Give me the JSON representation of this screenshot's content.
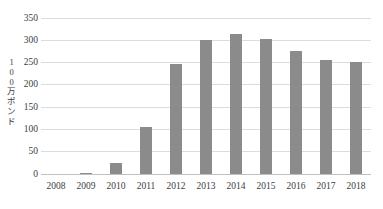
{
  "chart_data": {
    "type": "bar",
    "title": "",
    "categories": [
      "2008",
      "2009",
      "2010",
      "2011",
      "2012",
      "2013",
      "2014",
      "2015",
      "2016",
      "2017",
      "2018"
    ],
    "values": [
      0,
      3,
      24,
      105,
      247,
      301,
      315,
      302,
      277,
      256,
      251
    ],
    "xlabel": "",
    "ylabel": "100万ポンド",
    "ylim": [
      0,
      350
    ],
    "yticks": [
      0,
      50,
      100,
      150,
      200,
      250,
      300,
      350
    ],
    "grid": true,
    "legend": false,
    "bar_color": "#8b8b8b",
    "gridline_color": "#dcdcdc",
    "axis_line_color": "#c0c0c0",
    "text_color": "#3d3d3d"
  }
}
